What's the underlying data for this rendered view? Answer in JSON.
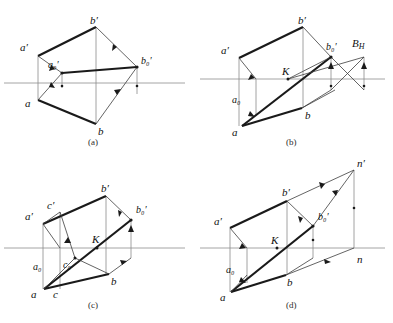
{
  "figure": {
    "panels": [
      {
        "id": "a",
        "caption": "(a)",
        "caption_x": 90,
        "caption_y": 144,
        "ground_line": {
          "x1": 4,
          "y1": 83,
          "x2": 185,
          "y2": 83
        },
        "labels": [
          {
            "name": "b-prime",
            "text": "b′",
            "x": 90,
            "y": 24
          },
          {
            "name": "a-prime",
            "text": "a′",
            "x": 20,
            "y": 48
          },
          {
            "name": "a0-prime",
            "text": "a₀′",
            "x": 52,
            "y": 67
          },
          {
            "name": "b0-prime",
            "text": "b₀′",
            "x": 140,
            "y": 64
          },
          {
            "name": "a-point",
            "text": "a",
            "x": 26,
            "y": 105
          },
          {
            "name": "b-point",
            "text": "b",
            "x": 98,
            "y": 133
          }
        ],
        "points": {
          "aP": [
            38,
            56
          ],
          "bP": [
            96,
            27
          ],
          "a0P": [
            62,
            73
          ],
          "b0P": [
            137,
            67
          ],
          "a": [
            38,
            100
          ],
          "b": [
            96,
            124
          ]
        }
      },
      {
        "id": "b",
        "caption": "(b)",
        "caption_x": 288,
        "caption_y": 144,
        "ground_line": {
          "x1": 200,
          "y1": 79,
          "x2": 385,
          "y2": 79
        },
        "labels": [
          {
            "name": "b-prime",
            "text": "b′",
            "x": 300,
            "y": 24
          },
          {
            "name": "a-prime",
            "text": "a′",
            "x": 222,
            "y": 51
          },
          {
            "name": "b0-prime",
            "text": "b₀′",
            "x": 329,
            "y": 50
          },
          {
            "name": "B-sub-H",
            "text": "B",
            "sub": "H",
            "x": 355,
            "y": 47
          },
          {
            "name": "K-point",
            "text": "K",
            "x": 294,
            "y": 73
          },
          {
            "name": "a0-point",
            "text": "a₀",
            "x": 233,
            "y": 100
          },
          {
            "name": "a-point",
            "text": "a",
            "x": 234,
            "y": 133
          },
          {
            "name": "b-point",
            "text": "b",
            "x": 307,
            "y": 117
          }
        ],
        "points": {
          "aP": [
            239,
            58
          ],
          "bP": [
            303,
            27
          ],
          "b0P": [
            331,
            57
          ],
          "a": [
            242,
            126
          ],
          "b": [
            302,
            108
          ],
          "K": [
            288,
            79
          ],
          "BH": [
            364,
            57
          ],
          "n": [
            335,
            79
          ]
        }
      },
      {
        "id": "c",
        "caption": "(c)",
        "caption_x": 90,
        "caption_y": 307,
        "ground_line": {
          "x1": 4,
          "y1": 248,
          "x2": 185,
          "y2": 248
        },
        "labels": [
          {
            "name": "b-prime",
            "text": "b′",
            "x": 103,
            "y": 188
          },
          {
            "name": "c-prime",
            "text": "c′",
            "x": 47,
            "y": 208
          },
          {
            "name": "a-prime",
            "text": "a′",
            "x": 26,
            "y": 216
          },
          {
            "name": "b0-prime",
            "text": "b₀′",
            "x": 138,
            "y": 212
          },
          {
            "name": "K-point",
            "text": "K",
            "x": 95,
            "y": 239
          },
          {
            "name": "a0-point",
            "text": "a₀",
            "x": 35,
            "y": 268
          },
          {
            "name": "c0-point",
            "text": "c₀",
            "x": 63,
            "y": 268
          },
          {
            "name": "a-point",
            "text": "a",
            "x": 32,
            "y": 295
          },
          {
            "name": "c-point",
            "text": "c",
            "x": 53,
            "y": 295
          },
          {
            "name": "b-point",
            "text": "b",
            "x": 112,
            "y": 282
          }
        ],
        "points": {
          "aP": [
            43,
            224
          ],
          "cP": [
            59,
            216
          ],
          "bP": [
            106,
            196
          ],
          "b0P": [
            131,
            220
          ],
          "a": [
            44,
            289
          ],
          "c": [
            60,
            289
          ],
          "b": [
            109,
            274
          ],
          "K": [
            97,
            248
          ]
        }
      },
      {
        "id": "d",
        "caption": "(d)",
        "caption_x": 288,
        "caption_y": 307,
        "ground_line": {
          "x1": 200,
          "y1": 248,
          "x2": 385,
          "y2": 248
        },
        "labels": [
          {
            "name": "n-prime",
            "text": "n′",
            "x": 357,
            "y": 165
          },
          {
            "name": "b-prime",
            "text": "b′",
            "x": 286,
            "y": 192
          },
          {
            "name": "a-prime",
            "text": "a′",
            "x": 216,
            "y": 222
          },
          {
            "name": "b0-prime",
            "text": "b₀′",
            "x": 316,
            "y": 218
          },
          {
            "name": "K-point",
            "text": "K",
            "x": 276,
            "y": 241
          },
          {
            "name": "a0-point",
            "text": "a₀",
            "x": 228,
            "y": 271
          },
          {
            "name": "a-point",
            "text": "a",
            "x": 221,
            "y": 297
          },
          {
            "name": "b-point",
            "text": "b",
            "x": 288,
            "y": 283
          },
          {
            "name": "n-point",
            "text": "n",
            "x": 354,
            "y": 262
          }
        ],
        "points": {
          "aP": [
            230,
            228
          ],
          "bP": [
            287,
            201
          ],
          "b0P": [
            313,
            226
          ],
          "a": [
            231,
            292
          ],
          "b": [
            286,
            275
          ],
          "K": [
            277,
            248
          ],
          "nP": [
            354,
            170
          ],
          "n": [
            354,
            248
          ]
        }
      }
    ]
  },
  "style": {
    "thick_stroke": "#1a1a1a",
    "thin_stroke": "#3c3c3c",
    "ground_line_color": "#9a9a9a",
    "projector_color": "#8a8a8a",
    "thick_width": 2.2,
    "thin_width": 0.8
  }
}
